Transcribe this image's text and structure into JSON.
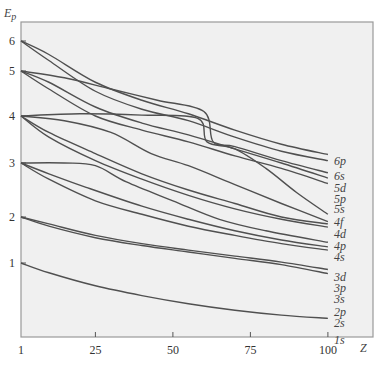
{
  "chart_data": {
    "type": "line",
    "title": "",
    "xlabel": "Z",
    "ylabel": "E_p",
    "xlim": [
      1,
      100
    ],
    "x_ticks": [
      "1",
      "25",
      "50",
      "75",
      "100"
    ],
    "y_ticks": [
      "1",
      "2",
      "3",
      "4",
      "5",
      "6"
    ],
    "grid": false,
    "legend": "inline labels at right end of curves",
    "series": [
      {
        "name": "6p",
        "points": [
          [
            1,
            6.0
          ],
          [
            10,
            5.55
          ],
          [
            25,
            4.75
          ],
          [
            40,
            4.35
          ],
          [
            55,
            4.05
          ],
          [
            70,
            3.7
          ],
          [
            85,
            3.4
          ],
          [
            100,
            3.18
          ]
        ]
      },
      {
        "name": "6s",
        "points": [
          [
            1,
            6.0
          ],
          [
            10,
            5.35
          ],
          [
            25,
            4.55
          ],
          [
            40,
            4.15
          ],
          [
            55,
            3.9
          ],
          [
            70,
            3.55
          ],
          [
            85,
            3.25
          ],
          [
            100,
            3.05
          ]
        ]
      },
      {
        "name": "5d",
        "points": [
          [
            1,
            5.0
          ],
          [
            15,
            4.85
          ],
          [
            30,
            4.6
          ],
          [
            45,
            4.35
          ],
          [
            60,
            4.1
          ],
          [
            63,
            3.45
          ],
          [
            70,
            3.35
          ],
          [
            85,
            3.05
          ],
          [
            100,
            2.82
          ]
        ]
      },
      {
        "name": "5p",
        "points": [
          [
            1,
            5.0
          ],
          [
            10,
            4.75
          ],
          [
            25,
            4.2
          ],
          [
            40,
            3.85
          ],
          [
            55,
            3.6
          ],
          [
            70,
            3.3
          ],
          [
            85,
            3.0
          ],
          [
            100,
            2.72
          ]
        ]
      },
      {
        "name": "5s",
        "points": [
          [
            1,
            5.0
          ],
          [
            10,
            4.6
          ],
          [
            25,
            4.0
          ],
          [
            40,
            3.7
          ],
          [
            55,
            3.45
          ],
          [
            70,
            3.15
          ],
          [
            85,
            2.9
          ],
          [
            100,
            2.62
          ]
        ]
      },
      {
        "name": "4f",
        "points": [
          [
            1,
            4.0
          ],
          [
            20,
            4.05
          ],
          [
            40,
            4.02
          ],
          [
            58,
            3.95
          ],
          [
            61,
            3.45
          ],
          [
            70,
            3.3
          ],
          [
            80,
            2.9
          ],
          [
            90,
            2.45
          ],
          [
            100,
            2.05
          ]
        ]
      },
      {
        "name": "4d",
        "points": [
          [
            1,
            4.0
          ],
          [
            15,
            3.9
          ],
          [
            30,
            3.65
          ],
          [
            43,
            3.2
          ],
          [
            55,
            2.95
          ],
          [
            70,
            2.6
          ],
          [
            85,
            2.25
          ],
          [
            100,
            1.9
          ]
        ]
      },
      {
        "name": "4p",
        "points": [
          [
            1,
            4.0
          ],
          [
            10,
            3.65
          ],
          [
            25,
            3.2
          ],
          [
            40,
            2.8
          ],
          [
            55,
            2.5
          ],
          [
            70,
            2.25
          ],
          [
            85,
            2.0
          ],
          [
            100,
            1.85
          ]
        ]
      },
      {
        "name": "4s",
        "points": [
          [
            1,
            4.0
          ],
          [
            10,
            3.55
          ],
          [
            25,
            3.05
          ],
          [
            40,
            2.7
          ],
          [
            55,
            2.4
          ],
          [
            70,
            2.15
          ],
          [
            85,
            1.95
          ],
          [
            100,
            1.78
          ]
        ]
      },
      {
        "name": "3d",
        "points": [
          [
            1,
            3.0
          ],
          [
            15,
            3.0
          ],
          [
            25,
            2.95
          ],
          [
            35,
            2.65
          ],
          [
            50,
            2.3
          ],
          [
            65,
            1.95
          ],
          [
            80,
            1.7
          ],
          [
            100,
            1.45
          ]
        ]
      },
      {
        "name": "3p",
        "points": [
          [
            1,
            3.0
          ],
          [
            10,
            2.8
          ],
          [
            22,
            2.55
          ],
          [
            40,
            2.2
          ],
          [
            55,
            1.95
          ],
          [
            70,
            1.7
          ],
          [
            85,
            1.5
          ],
          [
            100,
            1.35
          ]
        ]
      },
      {
        "name": "3s",
        "points": [
          [
            1,
            3.0
          ],
          [
            10,
            2.7
          ],
          [
            25,
            2.3
          ],
          [
            40,
            2.05
          ],
          [
            55,
            1.8
          ],
          [
            70,
            1.6
          ],
          [
            85,
            1.42
          ],
          [
            100,
            1.28
          ]
        ]
      },
      {
        "name": "2p",
        "points": [
          [
            1,
            2.0
          ],
          [
            10,
            1.85
          ],
          [
            25,
            1.6
          ],
          [
            40,
            1.42
          ],
          [
            55,
            1.28
          ],
          [
            70,
            1.15
          ],
          [
            85,
            1.02
          ],
          [
            100,
            0.92
          ]
        ]
      },
      {
        "name": "2s",
        "points": [
          [
            1,
            2.0
          ],
          [
            10,
            1.8
          ],
          [
            25,
            1.55
          ],
          [
            40,
            1.38
          ],
          [
            55,
            1.24
          ],
          [
            70,
            1.1
          ],
          [
            85,
            0.98
          ],
          [
            100,
            0.87
          ]
        ]
      },
      {
        "name": "1s",
        "points": [
          [
            1,
            1.0
          ],
          [
            10,
            0.88
          ],
          [
            25,
            0.72
          ],
          [
            40,
            0.6
          ],
          [
            55,
            0.5
          ],
          [
            70,
            0.42
          ],
          [
            85,
            0.36
          ],
          [
            100,
            0.32
          ]
        ]
      }
    ]
  },
  "axis": {
    "y_label": "E",
    "y_label_sub": "p",
    "x_label": "Z"
  }
}
